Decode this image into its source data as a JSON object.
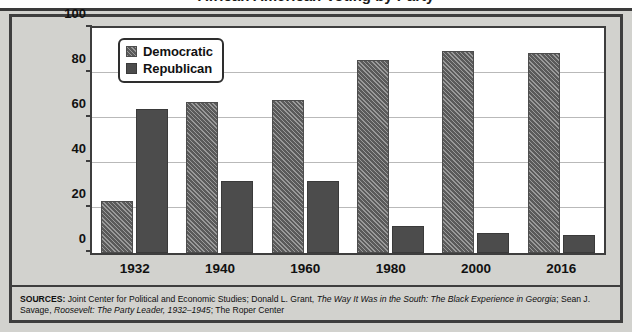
{
  "figure": {
    "title_cropped": "African American Voting by Party",
    "sources_prefix": "SOURCES:",
    "sources_line1_a": " Joint Center for Political and Economic Studies; Donald L. Grant, ",
    "sources_italic1": "The Way It Was in the South: The Black Experience in Georgia",
    "sources_line1_b": "; Sean J. Savage, ",
    "sources_italic2a": "Roosevelt: ",
    "sources_italic2b": "The Party Leader, 1932–1945",
    "sources_line2_b": "; The Roper Center"
  },
  "legend": {
    "position": "top-left-inside-plot",
    "items": [
      {
        "label": "Democratic",
        "swatch": "hatched-gray",
        "color": "#6e6e6e"
      },
      {
        "label": "Republican",
        "swatch": "solid-dark-gray",
        "color": "#4c4c4c"
      }
    ]
  },
  "chart_data": {
    "type": "bar",
    "title": "",
    "xlabel": "",
    "ylabel": "Percentage of African Americans who voted",
    "ylabel_line1": "Percentage of African Americans",
    "ylabel_line2": "who voted",
    "categories": [
      "1932",
      "1940",
      "1960",
      "1980",
      "2000",
      "2016"
    ],
    "series": [
      {
        "name": "Democratic",
        "values": [
          23,
          67,
          68,
          86,
          90,
          89
        ],
        "color": "#6e6e6e",
        "pattern": "diagonal-hatch"
      },
      {
        "name": "Republican",
        "values": [
          64,
          32,
          32,
          12,
          9,
          8
        ],
        "color": "#4c4c4c",
        "pattern": "solid"
      }
    ],
    "ylim": [
      0,
      100
    ],
    "yticks": [
      0,
      20,
      40,
      60,
      80,
      100
    ],
    "grid": true,
    "legend_position": "upper left"
  },
  "colors": {
    "figure_background": "#d2d2ce",
    "plot_background": "#ffffff",
    "frame": "#3e3e3e",
    "gridline": "#b9b9b9",
    "text": "#111111"
  }
}
